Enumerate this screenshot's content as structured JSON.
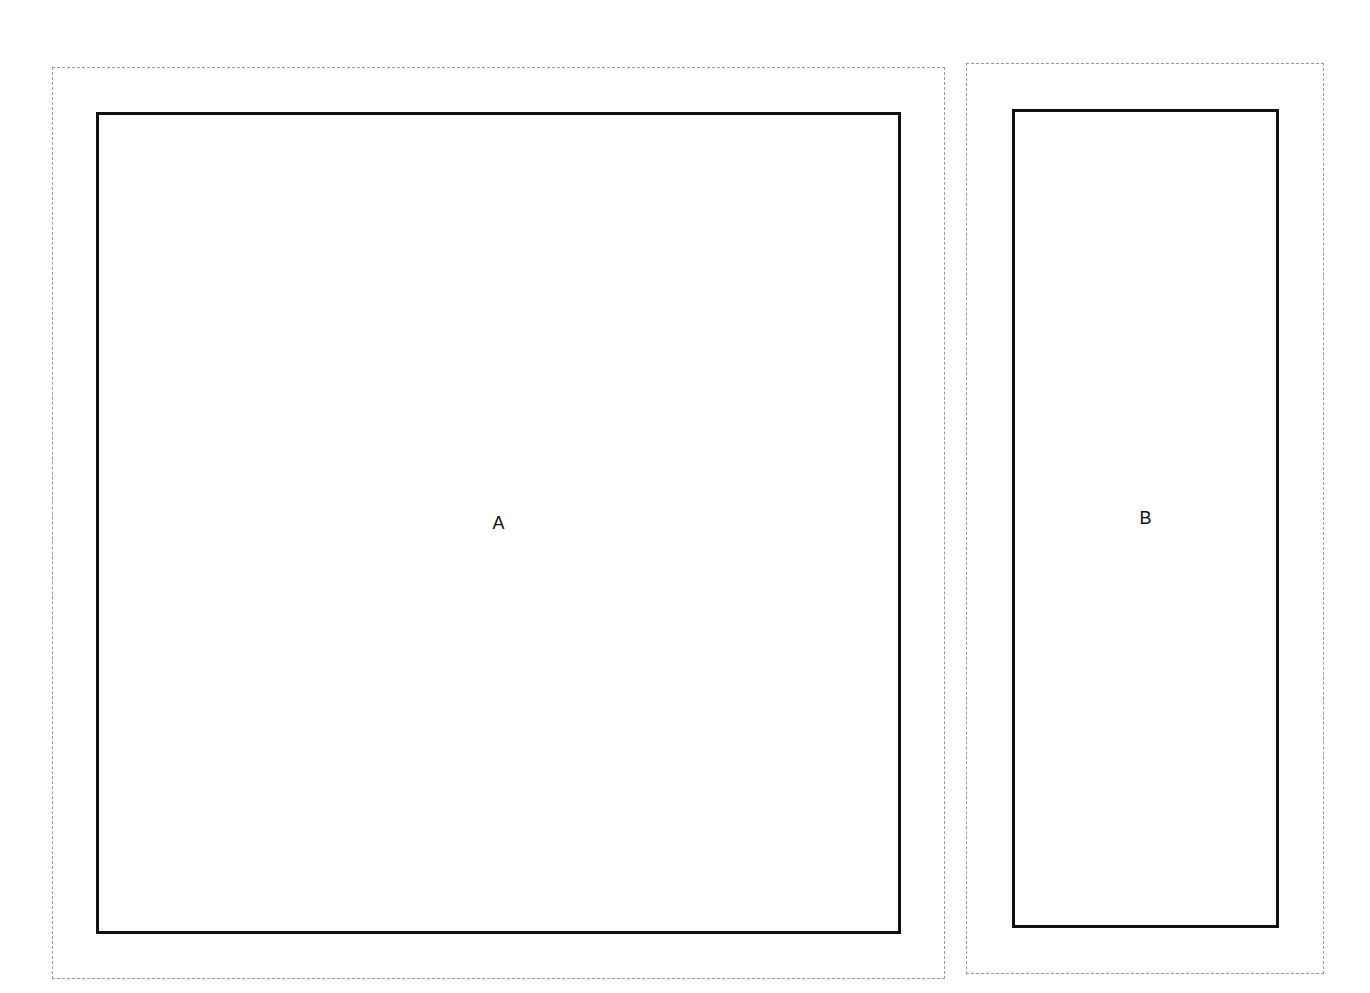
{
  "diagram": {
    "panels": [
      {
        "id": "A",
        "label": "A",
        "outer_border_style": "dashed",
        "inner_border_style": "solid"
      },
      {
        "id": "B",
        "label": "B",
        "outer_border_style": "dashed",
        "inner_border_style": "solid"
      }
    ],
    "colors": {
      "background": "#ffffff",
      "inner_border": "#111111",
      "outer_border": "#9a9a9a",
      "label": "#111111"
    }
  }
}
